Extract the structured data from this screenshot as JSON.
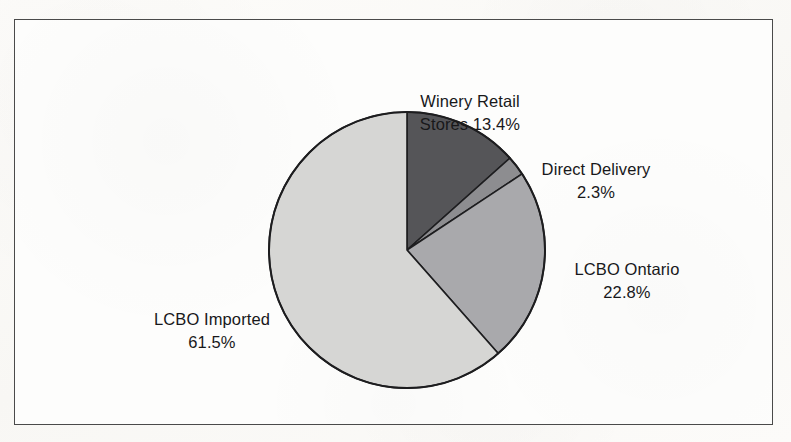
{
  "figure": {
    "frame_border_color": "#4a4a4a",
    "background_color": "#fdfdfc",
    "text_color": "#18181a"
  },
  "chart_data": {
    "type": "pie",
    "title": "",
    "subtitle": "",
    "xlabel": "",
    "ylabel": "",
    "legend_position": "none",
    "grid": false,
    "units": "percent",
    "start_angle_deg": 0,
    "direction": "clockwise",
    "center": {
      "x": 407,
      "y": 250
    },
    "radius": 138,
    "categories": [
      "Winery Retail Stores",
      "Direct Delivery",
      "LCBO Ontario",
      "LCBO Imported"
    ],
    "values": [
      13.4,
      2.3,
      22.8,
      61.5
    ],
    "colors": [
      "#555558",
      "#8d8d90",
      "#a9a9ac",
      "#d6d6d4"
    ],
    "slice_border_color": "#1d1d1f",
    "slices": [
      {
        "name": "Winery Retail Stores",
        "value": 13.4,
        "value_label": "13.4%",
        "color": "#555558",
        "start_deg": 0.0,
        "end_deg": 48.24,
        "label_line_1": "Winery Retail",
        "label_line_2": "Stores 13.4%"
      },
      {
        "name": "Direct Delivery",
        "value": 2.3,
        "value_label": "2.3%",
        "color": "#8d8d90",
        "start_deg": 48.24,
        "end_deg": 56.52,
        "label_line_1": "Direct Delivery",
        "label_line_2": "2.3%"
      },
      {
        "name": "LCBO Ontario",
        "value": 22.8,
        "value_label": "22.8%",
        "color": "#a9a9ac",
        "start_deg": 56.52,
        "end_deg": 138.6,
        "label_line_1": "LCBO Ontario",
        "label_line_2": "22.8%"
      },
      {
        "name": "LCBO Imported",
        "value": 61.5,
        "value_label": "61.5%",
        "color": "#d6d6d4",
        "start_deg": 138.6,
        "end_deg": 360.0,
        "label_line_1": "LCBO Imported",
        "label_line_2": "61.5%"
      }
    ]
  },
  "labels": {
    "winery": {
      "line1": "Winery Retail",
      "line2": "Stores 13.4%"
    },
    "direct": {
      "line1": "Direct Delivery",
      "line2": "2.3%"
    },
    "ontario": {
      "line1": "LCBO Ontario",
      "line2": "22.8%"
    },
    "imported": {
      "line1": "LCBO Imported",
      "line2": "61.5%"
    }
  }
}
